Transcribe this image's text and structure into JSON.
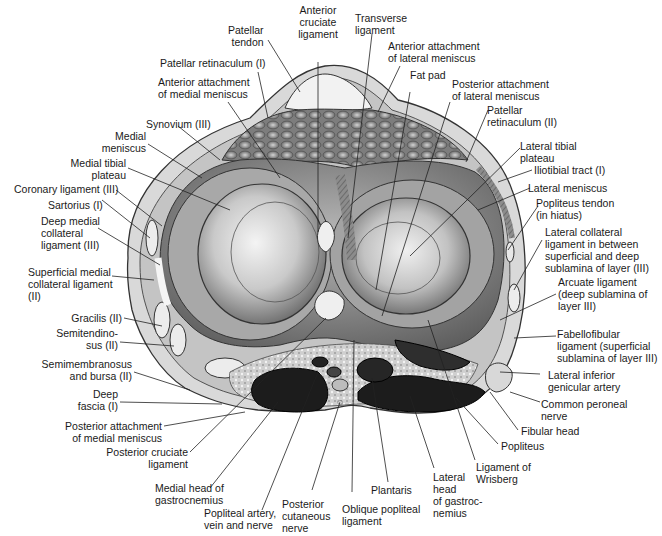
{
  "figure": {
    "colors": {
      "background": "#ffffff",
      "text": "#1a1a1a",
      "leader_line": "#222222",
      "fat_pad": "#8a8a8a",
      "cartilage_light": "#e6e6e6",
      "plateau_mid": "#9a9a9a",
      "muscle_dark": "#1c1c1c",
      "capsule": "#bdbdbd"
    }
  },
  "labels": {
    "top": [
      {
        "id": "patellar-tendon",
        "text": "Patellar\ntendon"
      },
      {
        "id": "anterior-cruciate-ligament",
        "text": "Anterior\ncruciate\nligament"
      },
      {
        "id": "transverse-ligament",
        "text": "Transverse\nligament"
      },
      {
        "id": "anterior-attachment-lateral-meniscus",
        "text": "Anterior attachment\nof lateral meniscus"
      },
      {
        "id": "fat-pad",
        "text": "Fat pad"
      },
      {
        "id": "posterior-attachment-lateral-meniscus",
        "text": "Posterior attachment\nof lateral meniscus"
      },
      {
        "id": "patellar-retinaculum-i",
        "text": "Patellar retinaculum (I)"
      },
      {
        "id": "anterior-attachment-medial-meniscus",
        "text": "Anterior attachment\nof medial meniscus"
      }
    ],
    "left": [
      {
        "id": "synovium-iii",
        "text": "Synovium (III)"
      },
      {
        "id": "medial-meniscus",
        "text": "Medial\nmeniscus"
      },
      {
        "id": "medial-tibial-plateau",
        "text": "Medial tibial\nplateau"
      },
      {
        "id": "coronary-ligament-iii",
        "text": "Coronary ligament (III)"
      },
      {
        "id": "sartorius-i",
        "text": "Sartorius (I)"
      },
      {
        "id": "deep-medial-collateral-ligament-iii",
        "text": "Deep medial\ncollateral\nligament (III)"
      },
      {
        "id": "superficial-medial-collateral-ligament-ii",
        "text": "Superficial medial\ncollateral ligament\n(II)"
      },
      {
        "id": "gracilis-ii",
        "text": "Gracilis (II)"
      },
      {
        "id": "semitendinosus-ii",
        "text": "Semitendino-\nsus (II)"
      },
      {
        "id": "semimembranosus-and-bursa-ii",
        "text": "Semimembranosus\nand bursa (II)"
      },
      {
        "id": "deep-fascia-i",
        "text": "Deep\nfascia (I)"
      },
      {
        "id": "posterior-attachment-medial-meniscus",
        "text": "Posterior attachment\nof medial meniscus"
      },
      {
        "id": "posterior-cruciate-ligament",
        "text": "Posterior cruciate\nligament"
      }
    ],
    "right": [
      {
        "id": "patellar-retinaculum-ii",
        "text": "Patellar\nretinaculum (II)"
      },
      {
        "id": "lateral-tibial-plateau",
        "text": "Lateral tibial\nplateau"
      },
      {
        "id": "iliotibial-tract-i",
        "text": "Iliotibial tract (I)"
      },
      {
        "id": "lateral-meniscus",
        "text": "Lateral meniscus"
      },
      {
        "id": "popliteus-tendon",
        "text": "Popliteus tendon\n(in hiatus)"
      },
      {
        "id": "lateral-collateral-ligament",
        "text": "Lateral collateral\nligament in between\nsuperficial and deep\nsublamina of layer (III)"
      },
      {
        "id": "arcuate-ligament",
        "text": "Arcuate ligament\n(deep sublamina of\nlayer III)"
      },
      {
        "id": "fabellofibular-ligament",
        "text": "Fabellofibular\nligament (superficial\nsublamina of layer III)"
      },
      {
        "id": "lateral-inferior-genicular-artery",
        "text": "Lateral inferior\ngenicular artery"
      },
      {
        "id": "common-peroneal-nerve",
        "text": "Common peroneal\nnerve"
      },
      {
        "id": "fibular-head",
        "text": "Fibular head"
      },
      {
        "id": "popliteus",
        "text": "Popliteus"
      }
    ],
    "bottom": [
      {
        "id": "medial-head-gastrocnemius",
        "text": "Medial head of\ngastrocnemius"
      },
      {
        "id": "popliteal-artery-vein-nerve",
        "text": "Popliteal artery,\nvein and nerve"
      },
      {
        "id": "posterior-cutaneous-nerve",
        "text": "Posterior\ncutaneous\nnerve"
      },
      {
        "id": "oblique-popliteal-ligament",
        "text": "Oblique popliteal\nligament"
      },
      {
        "id": "plantaris",
        "text": "Plantaris"
      },
      {
        "id": "lateral-head-gastrocnemius",
        "text": "Lateral\nhead\nof gastroc-\nnemius"
      },
      {
        "id": "ligament-of-wrisberg",
        "text": "Ligament of\nWrisberg"
      }
    ]
  }
}
